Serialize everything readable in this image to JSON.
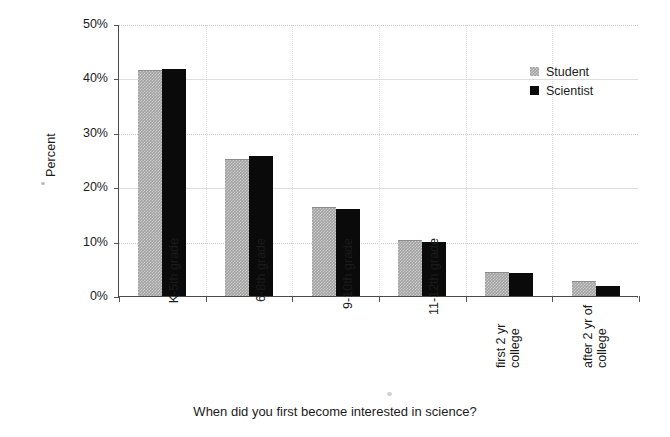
{
  "chart_data": {
    "type": "bar",
    "title": "",
    "caption": "When did you first become interested in science?",
    "xlabel": "",
    "ylabel": "Percent",
    "ylim": [
      0,
      50
    ],
    "ytick_labels": [
      "50%",
      "40%",
      "30%",
      "20%",
      "10%",
      "0%"
    ],
    "ytick_values": [
      50,
      40,
      30,
      20,
      10,
      0
    ],
    "grid": true,
    "legend_position": "top-right-inside",
    "categories": [
      "K-5th grade",
      "6-8th grade",
      "9-10th grade",
      "11-12th grade",
      "first 2 yr college",
      "after 2 yr of college"
    ],
    "category_label_lines": [
      [
        "K-5th grade"
      ],
      [
        "6-8th grade"
      ],
      [
        "9-10th grade"
      ],
      [
        "11-12th grade"
      ],
      [
        "first 2 yr",
        "college"
      ],
      [
        "after 2 yr of",
        "college"
      ]
    ],
    "series": [
      {
        "name": "Student",
        "color": "#a3a3a3",
        "values": [
          41.3,
          25.0,
          16.1,
          10.2,
          4.2,
          2.5
        ]
      },
      {
        "name": "Scientist",
        "color": "#0a0a0a",
        "values": [
          41.7,
          25.7,
          16.0,
          10.0,
          4.2,
          1.8
        ]
      }
    ]
  },
  "legend": {
    "entries": [
      {
        "label": "Student",
        "swatch": "student"
      },
      {
        "label": "Scientist",
        "swatch": "scientist"
      }
    ]
  },
  "axis": {
    "y_title": "Percent"
  },
  "caption": {
    "text": "When did you first become interested in science?"
  }
}
